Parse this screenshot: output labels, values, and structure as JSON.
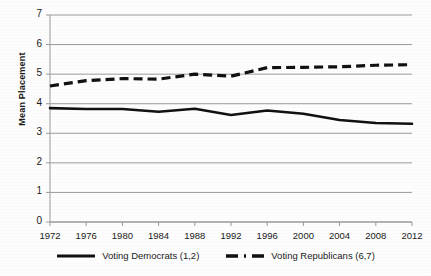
{
  "chart_data": {
    "type": "line",
    "title": "",
    "subtitle": "",
    "xlabel": "",
    "ylabel": "Mean Placement",
    "x": [
      1972,
      1976,
      1980,
      1984,
      1988,
      1992,
      1996,
      2000,
      2004,
      2008,
      2012
    ],
    "xtick_labels": [
      "1972",
      "1976",
      "1980",
      "1984",
      "1988",
      "1992",
      "1996",
      "2000",
      "2004",
      "2008",
      "2012"
    ],
    "ytick_labels": [
      "0",
      "1",
      "2",
      "3",
      "4",
      "5",
      "6",
      "7"
    ],
    "xlim": [
      1972,
      2012
    ],
    "ylim": [
      0,
      7
    ],
    "ytick_step": 1,
    "grid": "horizontal",
    "legend_position": "bottom",
    "series": [
      {
        "name": "Voting Democrats (1,2)",
        "style": "solid",
        "color": "#111111",
        "values": [
          3.85,
          3.82,
          3.82,
          3.73,
          3.83,
          3.62,
          3.77,
          3.66,
          3.45,
          3.35,
          3.32
        ]
      },
      {
        "name": "Voting Republicans (6,7)",
        "style": "dashed",
        "color": "#111111",
        "values": [
          4.6,
          4.78,
          4.85,
          4.83,
          5.0,
          4.93,
          5.22,
          5.23,
          5.25,
          5.3,
          5.32
        ]
      }
    ]
  },
  "legend": {
    "entries": [
      {
        "label": "Voting Democrats (1,2)",
        "swatch": "solid-line-swatch"
      },
      {
        "label": "Voting Republicans (6,7)",
        "swatch": "dashed-line-swatch"
      }
    ]
  },
  "colors": {
    "line": "#111111",
    "grid": "#9a9a9a",
    "axis": "#9a9a9a",
    "text": "#1a1a1a",
    "background": "#fdfdfd"
  }
}
